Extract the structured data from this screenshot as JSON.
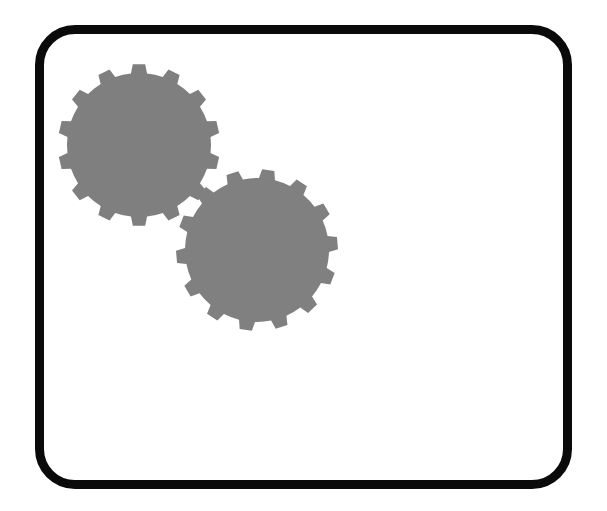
{
  "diagram": {
    "frame": {
      "stroke": "#0a0a0a",
      "fill": "#ffffff"
    },
    "gears": [
      {
        "id": "gear-1",
        "cx": 139,
        "cy": 145,
        "outer_r": 81,
        "inner_r": 72,
        "teeth": 14,
        "rotation": 0,
        "color": "#7f7f7f"
      },
      {
        "id": "gear-2",
        "cx": 257,
        "cy": 250,
        "outer_r": 81,
        "inner_r": 72,
        "teeth": 14,
        "rotation": 8,
        "color": "#808080"
      }
    ]
  }
}
